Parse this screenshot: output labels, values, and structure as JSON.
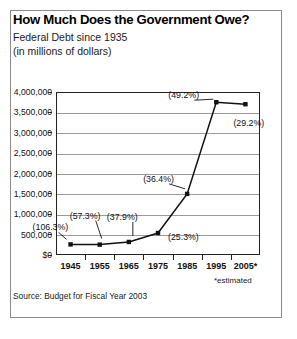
{
  "title": "How Much Does the Government Owe?",
  "subtitle_line1": "Federal Debt since 1935",
  "subtitle_line2": "(in millions of dollars)",
  "source": "Source: Budget for Fiscal Year 2003",
  "estimated_note": "*estimated",
  "colors": {
    "line": "#111111",
    "marker": "#111111",
    "grid": "#9a9a9a",
    "axis": "#222222",
    "frame": "#8a8a8a",
    "text": "#111111"
  },
  "chart_data": {
    "type": "line",
    "title": "How Much Does the Government Owe?",
    "subtitle": "Federal Debt since 1935 (in millions of dollars)",
    "xlabel": "",
    "ylabel": "",
    "categories": [
      "1945",
      "1955",
      "1965",
      "1975",
      "1985",
      "1995",
      "2005*"
    ],
    "x": [
      1945,
      1955,
      1965,
      1975,
      1985,
      1995,
      2005
    ],
    "values": [
      260000,
      255000,
      320000,
      540000,
      1500000,
      3750000,
      3700000
    ],
    "point_labels": [
      "(106.3%)",
      "(57.3%)",
      "(37.9%)",
      "(25.3%)",
      "(36.4%)",
      "(49.2%)",
      "(29.2%)"
    ],
    "ylim": [
      0,
      4000000
    ],
    "yticks": [
      0,
      500000,
      1000000,
      1500000,
      2000000,
      2500000,
      3000000,
      3500000,
      4000000
    ],
    "ytick_labels": [
      "$0",
      "500,000",
      "1,000,000",
      "1,500,000",
      "2,000,000",
      "2,500,000",
      "3,000,000",
      "3,500,000",
      "4,000,000"
    ],
    "grid": true,
    "legend": "none",
    "marker": "square",
    "annotations": [
      {
        "label": "(106.3%)",
        "year": "1945",
        "value": 260000,
        "placement": "above-left"
      },
      {
        "label": "(57.3%)",
        "year": "1955",
        "value": 255000,
        "placement": "above-left"
      },
      {
        "label": "(37.9%)",
        "year": "1965",
        "value": 320000,
        "placement": "above-left"
      },
      {
        "label": "(25.3%)",
        "year": "1975",
        "value": 540000,
        "placement": "right"
      },
      {
        "label": "(36.4%)",
        "year": "1985",
        "value": 1500000,
        "placement": "above-left"
      },
      {
        "label": "(49.2%)",
        "year": "1995",
        "value": 3750000,
        "placement": "above-left"
      },
      {
        "label": "(29.2%)",
        "year": "2005*",
        "value": 3700000,
        "placement": "below-left"
      }
    ]
  }
}
